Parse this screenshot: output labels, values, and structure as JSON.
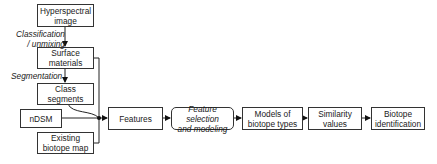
{
  "diagram": {
    "nodes": [
      {
        "id": "hyperspectral",
        "label": "Hyperspectral\nimage"
      },
      {
        "id": "surface",
        "label": "Surface\nmaterials"
      },
      {
        "id": "class_segments",
        "label": "Class\nsegments"
      },
      {
        "id": "ndsm",
        "label": "nDSM"
      },
      {
        "id": "existing_map",
        "label": "Existing\nbiotope map"
      },
      {
        "id": "features",
        "label": "Features"
      },
      {
        "id": "feature_selection",
        "label": "Feature selection\nand modeling"
      },
      {
        "id": "models",
        "label": "Models of\nbiotope types"
      },
      {
        "id": "similarity",
        "label": "Similarity\nvalues"
      },
      {
        "id": "identification",
        "label": "Biotope\nidentification"
      }
    ],
    "edge_labels": {
      "classification": "Classification\n/ unmixing",
      "segmentation": "Segmentation"
    },
    "edges": [
      [
        "hyperspectral",
        "surface"
      ],
      [
        "surface",
        "class_segments"
      ],
      [
        "surface",
        "features"
      ],
      [
        "class_segments",
        "features"
      ],
      [
        "ndsm",
        "features"
      ],
      [
        "existing_map",
        "features"
      ],
      [
        "features",
        "feature_selection"
      ],
      [
        "feature_selection",
        "models"
      ],
      [
        "models",
        "similarity"
      ],
      [
        "similarity",
        "identification"
      ]
    ]
  }
}
